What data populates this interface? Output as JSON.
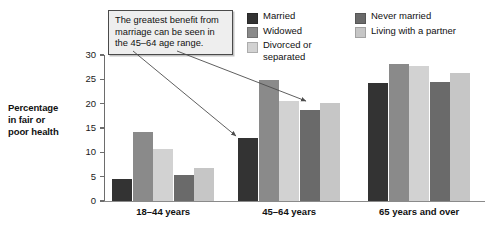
{
  "chart_data": {
    "type": "bar",
    "title": "",
    "xlabel": "",
    "ylabel": "Percentage in fair or poor health",
    "ylim": [
      0,
      30
    ],
    "yticks": [
      0,
      5,
      10,
      15,
      20,
      25,
      30
    ],
    "grid": false,
    "legend_position": "top-right",
    "categories": [
      "18–44 years",
      "45–64 years",
      "65 years and over"
    ],
    "series": [
      {
        "name": "Married",
        "color": "#333333",
        "values": [
          4.6,
          12.9,
          24.3
        ]
      },
      {
        "name": "Widowed",
        "color": "#8a8a8a",
        "values": [
          14.2,
          24.9,
          28.2
        ]
      },
      {
        "name": "Divorced or separated",
        "color": "#d2d2d2",
        "values": [
          10.6,
          20.6,
          27.8
        ]
      },
      {
        "name": "Never married",
        "color": "#6a6a6a",
        "values": [
          5.4,
          18.8,
          24.4
        ]
      },
      {
        "name": "Living with a partner",
        "color": "#c6c6c6",
        "values": [
          6.7,
          20.2,
          26.3
        ]
      }
    ],
    "annotations": [
      {
        "text": "The greatest benefit from marriage can be seen in the 45–64 age range.",
        "points_to": [
          "45–64 years / Married",
          "45–64 years / Never married"
        ]
      }
    ]
  },
  "axis": {
    "y_title_line1": "Percentage",
    "y_title_line2": "in fair or",
    "y_title_line3": "poor health"
  },
  "legend": {
    "column1": [
      {
        "label": "Married",
        "color": "#333333"
      },
      {
        "label": "Widowed",
        "color": "#8a8a8a"
      },
      {
        "label": "Divorced or separated",
        "color": "#d2d2d2"
      }
    ],
    "column2": [
      {
        "label": "Never married",
        "color": "#6a6a6a"
      },
      {
        "label": "Living with a partner",
        "color": "#c6c6c6"
      }
    ]
  },
  "callout": {
    "text": "The greatest benefit from marriage can be seen in the 45–64 age range."
  }
}
